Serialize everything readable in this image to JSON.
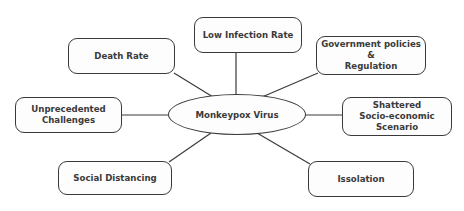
{
  "diagram": {
    "center": {
      "label": "Monkeypox Virus"
    },
    "nodes": [
      {
        "id": "low-infection-rate",
        "label": "Low Infection Rate"
      },
      {
        "id": "death-rate",
        "label": "Death Rate"
      },
      {
        "id": "government-policies",
        "label": "Government policies\n&\nRegulation"
      },
      {
        "id": "unprecedented-challenges",
        "label": "Unprecedented\nChallenges"
      },
      {
        "id": "shattered-socio-economic",
        "label": "Shattered\nSocio-economic\nScenario"
      },
      {
        "id": "social-distancing",
        "label": "Social Distancing"
      },
      {
        "id": "issolation",
        "label": "Issolation"
      }
    ],
    "colors": {
      "stroke": "#3a3a3a",
      "text": "#3a3a3a",
      "background": "#ffffff"
    }
  }
}
